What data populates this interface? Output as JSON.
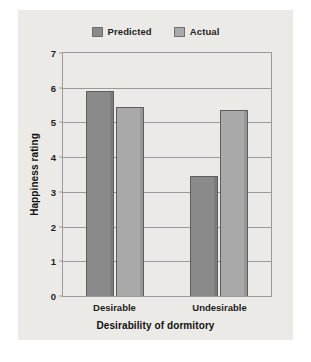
{
  "chart_data": {
    "type": "bar",
    "title": "",
    "categories": [
      "Desirable",
      "Undesirable"
    ],
    "series": [
      {
        "name": "Predicted",
        "values": [
          5.9,
          3.45
        ],
        "color": "#8a8a8a"
      },
      {
        "name": "Actual",
        "values": [
          5.45,
          5.35
        ],
        "color": "#a9a9a9"
      }
    ],
    "xlabel": "Desirability of dormitory",
    "ylabel": "Happiness rating",
    "ylim": [
      0,
      7
    ],
    "yticks": [
      0,
      1,
      2,
      3,
      4,
      5,
      6,
      7
    ],
    "ytick_labels": [
      "0",
      "1",
      "2",
      "3",
      "4",
      "5",
      "6",
      "7"
    ],
    "grid": true,
    "legend_position": "top-center"
  },
  "legend": {
    "entries": [
      {
        "label": "Predicted",
        "swatch": "predicted-swatch-icon"
      },
      {
        "label": "Actual",
        "swatch": "actual-swatch-icon"
      }
    ]
  },
  "axes": {
    "y_title": "Happiness rating",
    "x_title": "Desirability of dormitory",
    "y_ticks": [
      "7",
      "6",
      "5",
      "4",
      "3",
      "2",
      "1",
      "0"
    ],
    "x_ticks": [
      "Desirable",
      "Undesirable"
    ]
  },
  "colors": {
    "background": "#eceae7",
    "page": "#ffffff",
    "axis": "#9a9a9a",
    "bar_predicted": "#8a8a8a",
    "bar_actual": "#a9a9a9",
    "text": "#222222"
  }
}
